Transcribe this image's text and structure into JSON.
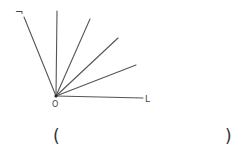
{
  "diagram": {
    "vertex": {
      "label": "O",
      "x": 56,
      "y": 96
    },
    "rays": [
      {
        "id": "ray-1",
        "x2": 24,
        "y2": 17
      },
      {
        "id": "ray-2",
        "x2": 57,
        "y2": 11
      },
      {
        "id": "ray-3",
        "x2": 90,
        "y2": 19
      },
      {
        "id": "ray-4",
        "x2": 118,
        "y2": 38
      },
      {
        "id": "ray-5",
        "x2": 136,
        "y2": 65
      },
      {
        "id": "ray-6",
        "x2": 143,
        "y2": 98
      }
    ],
    "left_label": "¬",
    "right_label": "L",
    "line_color": "#555555"
  },
  "answer": {
    "open": "(",
    "close": ")",
    "value": ""
  }
}
